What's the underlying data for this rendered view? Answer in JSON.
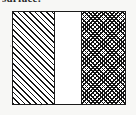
{
  "figure": {
    "caption_fragment": "surface:",
    "background_color": "#f7f7f5",
    "border_color": "#1c1c1c",
    "ink_color": "#131313",
    "fill_color": "#ffffff"
  },
  "diagram": {
    "type": "cross-section-layer-diagram",
    "outer_box": {
      "x": 12,
      "y": 11,
      "width": 114,
      "height": 94,
      "border_width_px": 1
    },
    "layers": [
      {
        "id": "layer-1",
        "name": "left-hatched-region",
        "pattern": "diagonal-hatch-45",
        "width_px": 42,
        "fill": "#ffffff",
        "line_color": "#161616",
        "line_spacing_px": 4,
        "label": ""
      },
      {
        "id": "layer-2",
        "name": "middle-blank-region",
        "pattern": "solid-white",
        "width_px": 27,
        "fill": "#ffffff",
        "line_color": "",
        "line_spacing_px": 0,
        "label": ""
      },
      {
        "id": "layer-3",
        "name": "right-crosshatched-region",
        "pattern": "cross-hatch-45",
        "width_px": 43,
        "fill": "#ffffff",
        "line_color": "#131313",
        "line_spacing_px": 3,
        "label": ""
      }
    ]
  }
}
